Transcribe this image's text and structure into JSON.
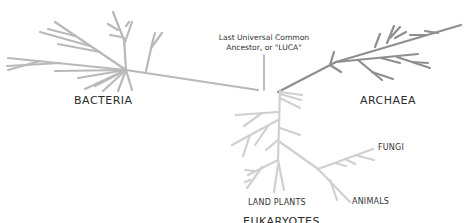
{
  "diagram": {
    "type": "phylogenetic-tree",
    "labels": {
      "luca_line1": "Last Universal Common",
      "luca_line2": "Ancestor, or \"LUCA\"",
      "bacteria": "BACTERIA",
      "archaea": "ARCHAEA",
      "fungi": "FUNGI",
      "land_plants": "LAND PLANTS",
      "animals": "ANIMALS",
      "eukaryotes": "EUKARYOTES"
    },
    "colors": {
      "bacteria_branch": "#b9b9b9",
      "archaea_branch": "#8f8f8f",
      "eukaryote_branch": "#d0d0d0",
      "label_text": "#2b2b2b"
    },
    "nodes": {
      "root": "LUCA",
      "domains": [
        "BACTERIA",
        "ARCHAEA",
        "EUKARYOTES"
      ],
      "eukaryote_groups": [
        "FUNGI",
        "LAND PLANTS",
        "ANIMALS"
      ]
    }
  }
}
